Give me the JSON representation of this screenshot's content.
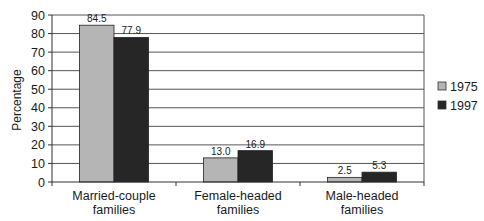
{
  "chart_data": {
    "type": "bar",
    "title": "",
    "xlabel": "",
    "ylabel": "Percentage",
    "ylim": [
      0,
      90
    ],
    "yticks": [
      0,
      10,
      20,
      30,
      40,
      50,
      60,
      70,
      80,
      90
    ],
    "grid": true,
    "legend_position": "right",
    "categories": [
      "Married-couple families",
      "Female-headed families",
      "Male-headed families"
    ],
    "category_lines": [
      [
        "Married-couple",
        "families"
      ],
      [
        "Female-headed",
        "families"
      ],
      [
        "Male-headed",
        "families"
      ]
    ],
    "series": [
      {
        "name": "1975",
        "color": "#b5b5b5",
        "values": [
          84.5,
          13.0,
          2.5
        ],
        "labels": [
          "84.5",
          "13.0",
          "2.5"
        ]
      },
      {
        "name": "1997",
        "color": "#262626",
        "values": [
          77.9,
          16.9,
          5.3
        ],
        "labels": [
          "77.9",
          "16.9",
          "5.3"
        ]
      }
    ]
  }
}
